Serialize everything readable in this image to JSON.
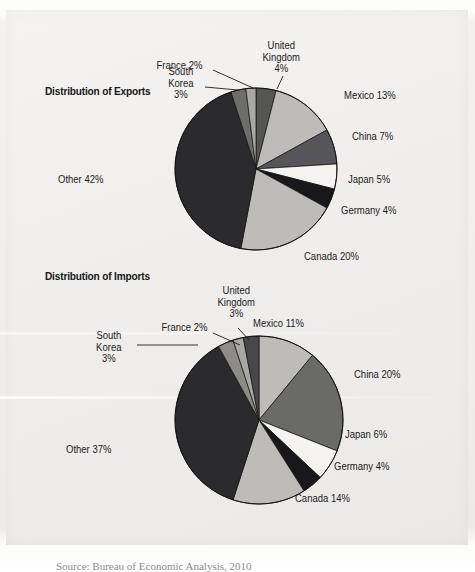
{
  "figure": {
    "background_hex": "#f1f0ee",
    "caption": "Source: Bureau of Economic Analysis, 2010"
  },
  "charts": [
    {
      "id": "exports",
      "title": "Distribution of Exports",
      "title_x": 45,
      "title_y": 85,
      "cx": 256,
      "cy": 169,
      "r": 81,
      "start_angle": -90,
      "labels": [
        {
          "key": "united_kingdom",
          "text": "United\nKingdom\n4%",
          "x": 248,
          "y": 40,
          "align": "c",
          "w": 70,
          "leader": [
            [
              283,
              76
            ],
            [
              277,
              89
            ]
          ]
        },
        {
          "key": "france",
          "text": "France 2%",
          "x": 150,
          "y": 60,
          "align": "c",
          "w": 62,
          "leader": [
            [
              213,
              70
            ],
            [
              253,
              88
            ]
          ]
        },
        {
          "key": "south_korea",
          "text": "South\nKorea\n3%",
          "x": 160,
          "y": 66,
          "align": "c",
          "w": 44,
          "leader": [
            [
              205,
              87
            ],
            [
              238,
              90
            ]
          ]
        },
        {
          "key": "mexico",
          "text": "Mexico 13%",
          "x": 344,
          "y": 90,
          "align": "l",
          "w": 80,
          "leader": null
        },
        {
          "key": "china",
          "text": "China 7%",
          "x": 352,
          "y": 131,
          "align": "l",
          "w": 70,
          "leader": null
        },
        {
          "key": "japan",
          "text": "Japan 5%",
          "x": 348,
          "y": 174,
          "align": "l",
          "w": 70,
          "leader": null
        },
        {
          "key": "germany",
          "text": "Germany 4%",
          "x": 341,
          "y": 205,
          "align": "l",
          "w": 82,
          "leader": null
        },
        {
          "key": "canada",
          "text": "Canada 20%",
          "x": 304,
          "y": 251,
          "align": "l",
          "w": 82,
          "leader": null
        },
        {
          "key": "other",
          "text": "Other 42%",
          "x": 58,
          "y": 174,
          "align": "l",
          "w": 72,
          "leader": null
        }
      ]
    },
    {
      "id": "imports",
      "title": "Distribution of Imports",
      "title_x": 45,
      "title_y": 270,
      "cx": 259,
      "cy": 420,
      "r": 84,
      "start_angle": -90,
      "labels": [
        {
          "key": "united_kingdom",
          "text": "United\nKingdom\n3%",
          "x": 203,
          "y": 285,
          "align": "c",
          "w": 70,
          "leader": [
            [
              238,
              328
            ],
            [
              249,
              340
            ]
          ]
        },
        {
          "key": "france",
          "text": "France 2%",
          "x": 155,
          "y": 322,
          "align": "c",
          "w": 62,
          "leader": [
            [
              213,
              333
            ],
            [
              240,
              345
            ]
          ]
        },
        {
          "key": "south_korea",
          "text": "South\nKorea\n3%",
          "x": 86,
          "y": 330,
          "align": "c",
          "w": 48,
          "leader": [
            [
              137,
              345
            ],
            [
              198,
              345
            ]
          ]
        },
        {
          "key": "mexico",
          "text": "Mexico 11%",
          "x": 253,
          "y": 318,
          "align": "l",
          "w": 80,
          "leader": null
        },
        {
          "key": "china",
          "text": "China 20%",
          "x": 354,
          "y": 369,
          "align": "l",
          "w": 76,
          "leader": null
        },
        {
          "key": "japan",
          "text": "Japan 6%",
          "x": 345,
          "y": 429,
          "align": "l",
          "w": 70,
          "leader": null
        },
        {
          "key": "germany",
          "text": "Germany 4%",
          "x": 334,
          "y": 461,
          "align": "l",
          "w": 82,
          "leader": null
        },
        {
          "key": "canada",
          "text": "Canada 14%",
          "x": 295,
          "y": 493,
          "align": "l",
          "w": 84,
          "leader": null
        },
        {
          "key": "other",
          "text": "Other 37%",
          "x": 66,
          "y": 444,
          "align": "l",
          "w": 72,
          "leader": null
        }
      ]
    }
  ],
  "chart_data": [
    {
      "type": "pie",
      "id": "exports",
      "title": "Distribution of Exports",
      "unit": "percent",
      "total": 100,
      "categories": [
        "Canada",
        "Mexico",
        "China",
        "Japan",
        "Germany",
        "United Kingdom",
        "South Korea",
        "France",
        "Other"
      ],
      "values": [
        20,
        13,
        7,
        5,
        4,
        4,
        3,
        2,
        42
      ],
      "slice_order_clockwise_from_12oclock": [
        {
          "label": "United Kingdom",
          "value": 4,
          "color": "#555553"
        },
        {
          "label": "Mexico",
          "value": 13,
          "color": "#bdbcb8"
        },
        {
          "label": "China",
          "value": 7,
          "color": "#56565a"
        },
        {
          "label": "Japan",
          "value": 5,
          "color": "#f4f3ef"
        },
        {
          "label": "Germany",
          "value": 4,
          "color": "#18181a"
        },
        {
          "label": "Canada",
          "value": 20,
          "color": "#bdbcb8"
        },
        {
          "label": "Other",
          "value": 42,
          "color": "#2b2b2d"
        },
        {
          "label": "South Korea",
          "value": 3,
          "color": "#6d6d6b"
        },
        {
          "label": "France",
          "value": 2,
          "color": "#a9a8a4"
        }
      ],
      "legend": "none",
      "data_labels": true
    },
    {
      "type": "pie",
      "id": "imports",
      "title": "Distribution of Imports",
      "unit": "percent",
      "total": 100,
      "categories": [
        "China",
        "Canada",
        "Mexico",
        "Japan",
        "Germany",
        "United Kingdom",
        "South Korea",
        "France",
        "Other"
      ],
      "values": [
        20,
        14,
        11,
        6,
        4,
        3,
        3,
        2,
        37
      ],
      "slice_order_clockwise_from_12oclock": [
        {
          "label": "Mexico",
          "value": 11,
          "color": "#bdbcb8"
        },
        {
          "label": "China",
          "value": 20,
          "color": "#6a6a68"
        },
        {
          "label": "Japan",
          "value": 6,
          "color": "#f4f3ef"
        },
        {
          "label": "Germany",
          "value": 4,
          "color": "#18181a"
        },
        {
          "label": "Canada",
          "value": 14,
          "color": "#bdbcb8"
        },
        {
          "label": "Other",
          "value": 37,
          "color": "#2b2b2d"
        },
        {
          "label": "South Korea",
          "value": 3,
          "color": "#8d8c89"
        },
        {
          "label": "France",
          "value": 2,
          "color": "#a9a8a4"
        },
        {
          "label": "United Kingdom",
          "value": 3,
          "color": "#48484a"
        }
      ],
      "legend": "none",
      "data_labels": true
    }
  ]
}
